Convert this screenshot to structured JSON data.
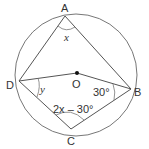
{
  "diagram": {
    "type": "circle-geometry",
    "circle": {
      "center_label": "O"
    },
    "points": [
      {
        "id": "A",
        "label": "A"
      },
      {
        "id": "B",
        "label": "B"
      },
      {
        "id": "C",
        "label": "C"
      },
      {
        "id": "D",
        "label": "D"
      },
      {
        "id": "O",
        "label": "O"
      }
    ],
    "segments": [
      "AB",
      "AD",
      "BC",
      "CD",
      "DO",
      "OB"
    ],
    "angles": {
      "A": {
        "label": "x"
      },
      "D": {
        "label": "y"
      },
      "B": {
        "label": "30°"
      },
      "C": {
        "label": "2x – 30°"
      }
    },
    "colors": {
      "stroke": "#555555",
      "text": "#333333",
      "background": "#ffffff"
    }
  }
}
